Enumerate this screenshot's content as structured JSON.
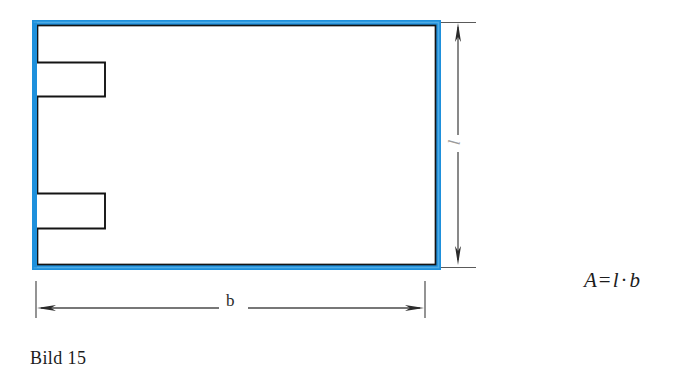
{
  "figure": {
    "caption": "Bild 15",
    "formula": {
      "lhs": "A",
      "equals": "=",
      "factor_1": "l",
      "operator": "·",
      "factor_2": "b"
    },
    "dimensions": {
      "width_label": "b",
      "height_label": "l"
    },
    "colors": {
      "highlight_blue": "#1E90DC",
      "outline_black": "#141414",
      "dimension_gray": "#4a4a4a",
      "text_black": "#1c1c1c",
      "background": "#ffffff"
    },
    "shape": {
      "name": "rectangle-with-two-left-notches",
      "notch_count": 2
    }
  }
}
